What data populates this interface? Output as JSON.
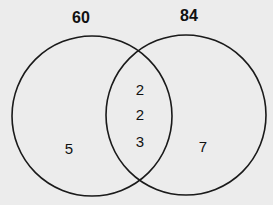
{
  "diagram": {
    "type": "venn",
    "sets": [
      {
        "label": "60",
        "only_elements": [
          "5"
        ]
      },
      {
        "label": "84",
        "only_elements": [
          "7"
        ]
      }
    ],
    "intersection": [
      "2",
      "2",
      "3"
    ]
  }
}
